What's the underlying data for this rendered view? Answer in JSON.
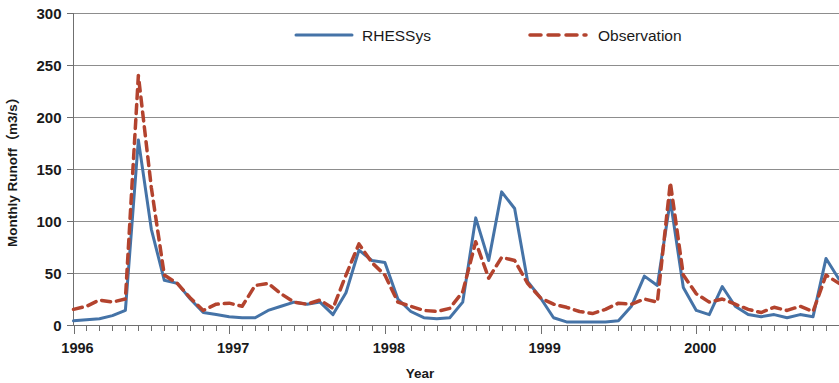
{
  "chart_data": {
    "type": "line",
    "title": "",
    "xlabel": "Year",
    "ylabel": "Monthly Runoff（m3/s）",
    "ylim": [
      0,
      300
    ],
    "yticks": [
      0,
      50,
      100,
      150,
      200,
      250,
      300
    ],
    "ytick_labels": [
      "0",
      "50",
      "100",
      "150",
      "200",
      "250",
      "300"
    ],
    "xtick_labels": [
      "1996",
      "1997",
      "1998",
      "1999",
      "2000"
    ],
    "xtick_values": [
      0,
      12,
      24,
      36,
      48
    ],
    "x_minor_tick_interval_months": 1,
    "xlim": [
      0,
      59
    ],
    "grid": "horizontal",
    "legend_position": "top-center",
    "x": [
      "1996-01",
      "1996-02",
      "1996-03",
      "1996-04",
      "1996-05",
      "1996-06",
      "1996-07",
      "1996-08",
      "1996-09",
      "1996-10",
      "1996-11",
      "1996-12",
      "1997-01",
      "1997-02",
      "1997-03",
      "1997-04",
      "1997-05",
      "1997-06",
      "1997-07",
      "1997-08",
      "1997-09",
      "1997-10",
      "1997-11",
      "1997-12",
      "1998-01",
      "1998-02",
      "1998-03",
      "1998-04",
      "1998-05",
      "1998-06",
      "1998-07",
      "1998-08",
      "1998-09",
      "1998-10",
      "1998-11",
      "1998-12",
      "1999-01",
      "1999-02",
      "1999-03",
      "1999-04",
      "1999-05",
      "1999-06",
      "1999-07",
      "1999-08",
      "1999-09",
      "1999-10",
      "1999-11",
      "1999-12",
      "2000-01",
      "2000-02",
      "2000-03",
      "2000-04",
      "2000-05",
      "2000-06",
      "2000-07",
      "2000-08",
      "2000-09",
      "2000-10",
      "2000-11",
      "2000-12"
    ],
    "series": [
      {
        "name": "RHESSys",
        "color": "#4573a7",
        "style": "solid",
        "width": 3,
        "values": [
          4,
          5,
          6,
          9,
          14,
          178,
          92,
          43,
          40,
          25,
          12,
          10,
          8,
          7,
          7,
          14,
          18,
          22,
          20,
          22,
          10,
          31,
          72,
          62,
          60,
          25,
          13,
          7,
          6,
          7,
          22,
          103,
          62,
          128,
          112,
          42,
          26,
          7,
          3,
          3,
          3,
          3,
          4,
          18,
          47,
          38,
          120,
          36,
          14,
          10,
          37,
          18,
          10,
          8,
          10,
          7,
          10,
          8,
          64,
          44
        ]
      },
      {
        "name": "Observation",
        "color": "#b3432e",
        "style": "dashed",
        "width": 3.5,
        "values": [
          15,
          18,
          24,
          22,
          25,
          240,
          132,
          48,
          40,
          26,
          14,
          20,
          21,
          18,
          38,
          40,
          30,
          22,
          20,
          24,
          16,
          48,
          78,
          60,
          48,
          22,
          18,
          14,
          13,
          16,
          32,
          80,
          45,
          65,
          62,
          40,
          26,
          20,
          17,
          13,
          11,
          15,
          21,
          20,
          25,
          22,
          137,
          48,
          30,
          22,
          25,
          20,
          15,
          12,
          17,
          14,
          18,
          13,
          48,
          40
        ]
      }
    ]
  },
  "legend": {
    "items": [
      {
        "label": "RHESSys",
        "color": "#4573a7",
        "style": "solid"
      },
      {
        "label": "Observation",
        "color": "#b3432e",
        "style": "dashed"
      }
    ]
  },
  "axes": {
    "y_title": "Monthly Runoff（m3/s）",
    "x_title": "Year"
  }
}
